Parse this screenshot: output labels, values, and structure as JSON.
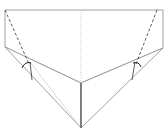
{
  "diagram": {
    "type": "fold-diagram",
    "colors": {
      "line": "#8a8a8a",
      "dark": "#333333",
      "shade": "#e8e8e8",
      "center_line": "#c0c0c0"
    },
    "shapes": {
      "top_rect": {
        "points": "5,10 163,10 163,48 81,83 5,47"
      },
      "lower_left_flap": {
        "points": "5,47 81,83 81,128"
      },
      "lower_right_flap": {
        "points": "163,48 81,83 81,128"
      },
      "left_shade": {
        "points": "5,47 28,57 32,66"
      },
      "right_shade": {
        "points": "163,48 139,58 136,66"
      }
    },
    "lines": {
      "center_dotted": {
        "x1": 81,
        "y1": 10,
        "x2": 81,
        "y2": 83
      },
      "center_solid": {
        "x1": 81,
        "y1": 83,
        "x2": 81,
        "y2": 128
      },
      "left_dashed": {
        "x1": 5,
        "y1": 10,
        "x2": 29,
        "y2": 64
      },
      "right_dashed": {
        "x1": 157,
        "y1": 10,
        "x2": 136,
        "y2": 64
      },
      "left_inner": {
        "x1": 30,
        "y1": 62,
        "x2": 32,
        "y2": 80
      },
      "right_inner": {
        "x1": 135,
        "y1": 62,
        "x2": 132,
        "y2": 80
      }
    }
  }
}
